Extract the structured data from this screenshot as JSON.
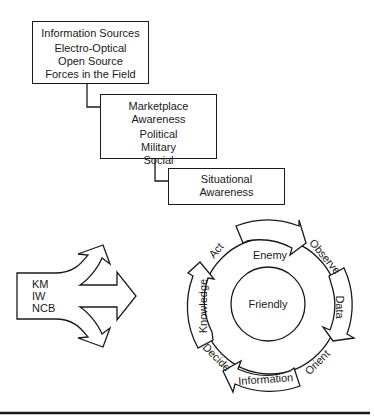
{
  "info_sources": {
    "title": "Information Sources",
    "items": [
      "Electro-Optical",
      "Open Source",
      "Forces in the Field"
    ]
  },
  "marketplace": {
    "title": "Marketplace Awareness",
    "items": [
      "Political",
      "Military",
      "Social"
    ]
  },
  "situational": {
    "lines": [
      "Situational",
      "Awareness"
    ]
  },
  "inputs": {
    "items": [
      "KM",
      "IW",
      "NCB"
    ]
  },
  "cycle": {
    "outer_label": "Enemy",
    "inner_label": "Friendly",
    "ooda": [
      "Observe",
      "Orient",
      "Decide",
      "Act"
    ],
    "arrows": [
      "Data",
      "Information",
      "Knowledge"
    ]
  },
  "colors": {
    "stroke": "#1a1a1a",
    "background": "#ffffff"
  }
}
